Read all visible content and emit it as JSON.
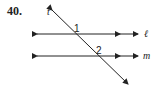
{
  "problem": {
    "number": "40."
  },
  "diagram": {
    "transversal_label": "t",
    "line_l_label": "ℓ",
    "line_m_label": "m",
    "angle_1_label": "1",
    "angle_2_label": "2",
    "stroke_color": "#222222"
  }
}
